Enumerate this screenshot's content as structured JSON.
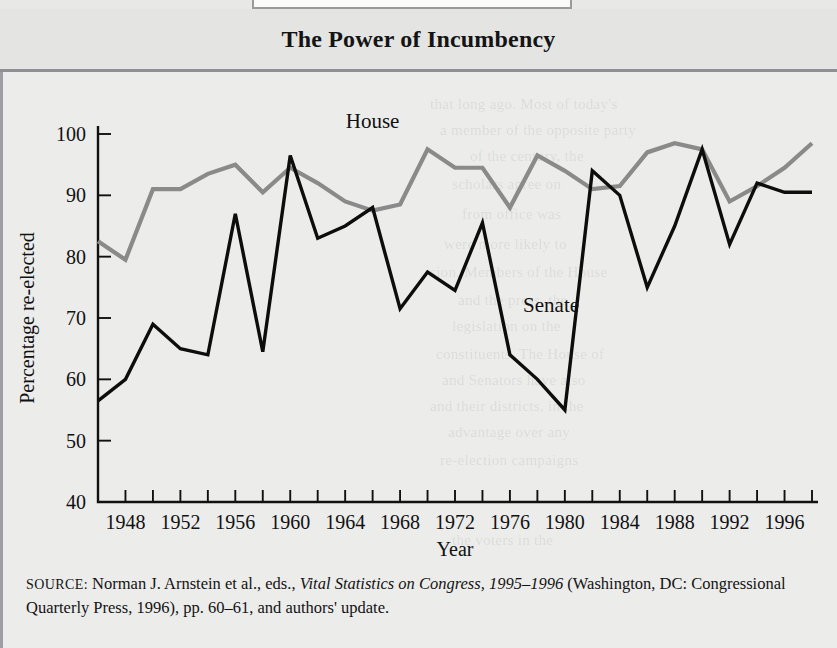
{
  "figure": {
    "number_plate": "FIGURE 11.3",
    "title": "The Power of Incumbency"
  },
  "source": {
    "label": "SOURCE:",
    "text_before_italic": " Norman J. Arnstein et al., eds., ",
    "italic_text": "Vital Statistics on Congress, 1995–1996",
    "text_after_italic": " (Washington, DC: Congressional Quarterly Press, 1996), pp. 60–61, and authors' update."
  },
  "colors": {
    "house_line": "#8a8a8a",
    "senate_line": "#0d0d0d",
    "axis": "#111111",
    "panel_background": "#ececeb",
    "title_background": "#e4e4e2",
    "rule": "#8e8e95"
  },
  "ghost_text": [
    {
      "text": "that long ago. Most of today's",
      "x": 430,
      "y": 96
    },
    {
      "text": "a member of the opposite party",
      "x": 440,
      "y": 122
    },
    {
      "text": "of the century, the",
      "x": 470,
      "y": 148
    },
    {
      "text": "scholars agree on",
      "x": 452,
      "y": 176
    },
    {
      "text": "from office was",
      "x": 462,
      "y": 206
    },
    {
      "text": "were more likely to",
      "x": 444,
      "y": 236
    },
    {
      "text": "sion. Members of the House",
      "x": 430,
      "y": 264
    },
    {
      "text": "and the press, the",
      "x": 458,
      "y": 292
    },
    {
      "text": "legislation on the",
      "x": 452,
      "y": 318
    },
    {
      "text": "constituents. The House of",
      "x": 436,
      "y": 346
    },
    {
      "text": "and Senators have also",
      "x": 442,
      "y": 372
    },
    {
      "text": "and their districts, in the",
      "x": 430,
      "y": 398
    },
    {
      "text": "advantage over any",
      "x": 448,
      "y": 424
    },
    {
      "text": "re-election campaigns",
      "x": 440,
      "y": 452
    },
    {
      "text": "the voters in the",
      "x": 452,
      "y": 532
    }
  ],
  "chart_data": {
    "type": "line",
    "title": "The Power of Incumbency",
    "xlabel": "Year",
    "ylabel": "Percentage re-elected",
    "xlim": [
      1946,
      1998
    ],
    "ylim": [
      40,
      100
    ],
    "ytick_values": [
      40,
      50,
      60,
      70,
      80,
      90,
      100
    ],
    "ytick_labels": [
      "40",
      "50",
      "60",
      "70",
      "80",
      "90",
      "100"
    ],
    "xtick_values": [
      1946,
      1948,
      1950,
      1952,
      1954,
      1956,
      1958,
      1960,
      1962,
      1964,
      1966,
      1968,
      1970,
      1972,
      1974,
      1976,
      1978,
      1980,
      1982,
      1984,
      1986,
      1988,
      1990,
      1992,
      1994,
      1996,
      1998
    ],
    "xtick_labeled": [
      1948,
      1952,
      1956,
      1960,
      1964,
      1968,
      1972,
      1976,
      1980,
      1984,
      1988,
      1992,
      1996
    ],
    "grid": false,
    "legend": "inline-labels",
    "x": [
      1946,
      1948,
      1950,
      1952,
      1954,
      1956,
      1958,
      1960,
      1962,
      1964,
      1966,
      1968,
      1970,
      1972,
      1974,
      1976,
      1978,
      1980,
      1982,
      1984,
      1986,
      1988,
      1990,
      1992,
      1994,
      1996,
      1998
    ],
    "series": [
      {
        "name": "House",
        "color": "#8a8a8a",
        "label_x": 1966,
        "label_y": 101,
        "values": [
          82.5,
          79.5,
          91,
          91,
          93.5,
          95,
          90.5,
          94.5,
          92,
          89,
          87.5,
          88.5,
          97.5,
          94.5,
          94.5,
          88,
          96.5,
          94,
          91,
          91.5,
          97,
          98.5,
          97.5,
          89,
          91.5,
          94.5,
          98.5
        ]
      },
      {
        "name": "Senate",
        "color": "#0d0d0d",
        "label_x": 1979,
        "label_y": 71,
        "values": [
          56.5,
          60,
          69,
          65,
          64,
          87,
          64.5,
          96.5,
          83,
          85,
          88,
          71.5,
          77.5,
          74.5,
          85.5,
          64,
          60,
          55,
          94,
          90,
          75,
          85,
          97.5,
          82,
          92,
          90.5,
          90.5
        ]
      }
    ]
  }
}
